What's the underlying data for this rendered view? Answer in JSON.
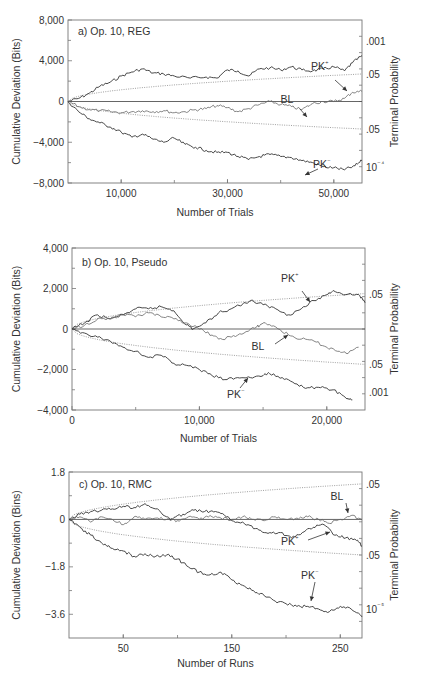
{
  "chart_data": [
    {
      "type": "line",
      "panel": "a",
      "title": "a) Op. 10, REG",
      "xlabel": "Number of Trials",
      "ylabel": "Cumulative Deviation (Bits)",
      "y2label": "Terminal Probability",
      "xlim": [
        0,
        55300
      ],
      "ylim": [
        -8000,
        8000
      ],
      "x_ticks": [
        10000,
        30000,
        50000
      ],
      "x_tick_labels": [
        "10,000",
        "30,000",
        "50,000"
      ],
      "y_ticks": [
        8000,
        4000,
        0,
        -4000,
        -8000
      ],
      "y_tick_labels": [
        "8,000",
        "4,000",
        "0",
        "−4,000",
        "−8,000"
      ],
      "y2_tick_labels": [
        {
          "label": ".001",
          "y": 5900
        },
        {
          "label": ".05",
          "y": 2700
        },
        {
          "label": ".05",
          "y": -2700
        },
        {
          "label": "10⁻⁴",
          "y": -6400
        }
      ],
      "envelope_end": 2700,
      "series": [
        {
          "name": "PK+",
          "x": [
            0,
            2000,
            4000,
            6000,
            8000,
            10000,
            12000,
            14000,
            16000,
            18000,
            20000,
            23000,
            26000,
            28000,
            30000,
            32000,
            34000,
            36000,
            38000,
            40000,
            42000,
            44000,
            46000,
            48000,
            50000,
            52000,
            53500,
            55300
          ],
          "values": [
            0,
            300,
            800,
            1500,
            1900,
            2500,
            2900,
            3200,
            2800,
            2700,
            2500,
            2300,
            2400,
            2300,
            3100,
            3000,
            2500,
            3200,
            3300,
            3100,
            3400,
            3100,
            3000,
            3200,
            3400,
            3000,
            3800,
            4500
          ]
        },
        {
          "name": "BL",
          "x": [
            0,
            2000,
            4000,
            6000,
            8000,
            10000,
            12000,
            14000,
            16000,
            18000,
            20000,
            22000,
            24000,
            26000,
            28000,
            30000,
            32000,
            34000,
            36000,
            38000,
            40000,
            42000,
            44000,
            46000,
            48000,
            50000,
            52000,
            53500,
            55300
          ],
          "values": [
            0,
            -500,
            -800,
            -900,
            -1000,
            -1100,
            -1000,
            -900,
            -1000,
            -900,
            -1100,
            -1000,
            -800,
            -700,
            -400,
            -600,
            -1000,
            -700,
            -300,
            0,
            -300,
            -500,
            -800,
            -200,
            0,
            0,
            300,
            900,
            1000
          ]
        },
        {
          "name": "PK−",
          "x": [
            0,
            2000,
            4000,
            6000,
            8000,
            10000,
            12000,
            14000,
            16000,
            18000,
            20000,
            22000,
            24000,
            26000,
            28000,
            30000,
            32000,
            34000,
            36000,
            38000,
            40000,
            42000,
            44000,
            46000,
            48000,
            50000,
            52000,
            54000,
            55300
          ],
          "values": [
            0,
            -1000,
            -1700,
            -2100,
            -2500,
            -3000,
            -3500,
            -3200,
            -3700,
            -4000,
            -3600,
            -4200,
            -4500,
            -4800,
            -5000,
            -5000,
            -5400,
            -5700,
            -5400,
            -5200,
            -5400,
            -5500,
            -5800,
            -6000,
            -6400,
            -6500,
            -6700,
            -6300,
            -5800
          ]
        }
      ],
      "annotations": [
        {
          "text": "PK⁺",
          "target": "PK+"
        },
        {
          "text": "BL",
          "target": "BL"
        },
        {
          "text": "PK⁻",
          "target": "PK−"
        }
      ]
    },
    {
      "type": "line",
      "panel": "b",
      "title": "b) Op. 10, Pseudo",
      "xlabel": "Number of Trials",
      "ylabel": "Cumulative Deviation (Bits)",
      "y2label": "Terminal Probability",
      "xlim": [
        0,
        23000
      ],
      "ylim": [
        -4000,
        4000
      ],
      "x_ticks": [
        0,
        10000,
        20000
      ],
      "x_tick_labels": [
        "0",
        "10,000",
        "20,000"
      ],
      "y_ticks": [
        4000,
        2000,
        0,
        -2000,
        -4000
      ],
      "y_tick_labels": [
        "4,000",
        "2,000",
        "0",
        "−2,000",
        "−4,000"
      ],
      "y2_tick_labels": [
        {
          "label": ".05",
          "y": 1750
        },
        {
          "label": ".05",
          "y": -1750
        },
        {
          "label": ".001",
          "y": -3100
        }
      ],
      "envelope_end": 1750,
      "series": [
        {
          "name": "PK+",
          "x": [
            0,
            1000,
            2000,
            3000,
            4000,
            5000,
            6000,
            7000,
            8000,
            9000,
            9500,
            10500,
            11500,
            12500,
            14000,
            15000,
            16000,
            17000,
            18000,
            19000,
            20000,
            20500,
            21500,
            22500,
            23000
          ],
          "values": [
            0,
            300,
            700,
            500,
            700,
            1000,
            1000,
            1100,
            900,
            200,
            0,
            300,
            800,
            1000,
            1400,
            1200,
            1000,
            700,
            1000,
            1400,
            1700,
            1900,
            1700,
            1700,
            1300
          ]
        },
        {
          "name": "BL",
          "x": [
            0,
            1000,
            2000,
            3000,
            4000,
            5000,
            6000,
            7000,
            8000,
            9000,
            10000,
            11000,
            11500,
            12500,
            13500,
            14500,
            15000,
            16000,
            17000,
            18000,
            19000,
            20000,
            21000,
            21500,
            22500
          ],
          "values": [
            0,
            200,
            500,
            500,
            700,
            600,
            800,
            600,
            500,
            300,
            0,
            -300,
            -500,
            -400,
            -200,
            100,
            300,
            100,
            -300,
            -500,
            -600,
            -900,
            -1100,
            -1200,
            -900
          ]
        },
        {
          "name": "PK−",
          "x": [
            0,
            1000,
            2000,
            3000,
            4000,
            5000,
            6000,
            7000,
            8000,
            9000,
            10000,
            11000,
            12000,
            13000,
            14000,
            15000,
            15500,
            16500,
            17500,
            18500,
            19500,
            20500,
            21500,
            22000
          ],
          "values": [
            0,
            -200,
            -400,
            -600,
            -900,
            -1100,
            -1400,
            -1300,
            -1700,
            -1800,
            -2000,
            -2300,
            -2500,
            -2400,
            -2400,
            -2300,
            -2200,
            -2400,
            -2700,
            -2900,
            -2900,
            -3000,
            -3400,
            -3500
          ]
        }
      ],
      "annotations": [
        {
          "text": "PK⁺",
          "target": "PK+"
        },
        {
          "text": "BL",
          "target": "BL"
        },
        {
          "text": "PK⁻",
          "target": "PK−"
        }
      ]
    },
    {
      "type": "line",
      "panel": "c",
      "title": "c) Op. 10, RMC",
      "xlabel": "Number of Runs",
      "ylabel": "Cumulative Deviation (Bins)",
      "y2label": "Terminal Probability",
      "xlim": [
        0,
        270
      ],
      "ylim": [
        -4.5,
        1.8
      ],
      "x_ticks": [
        50,
        150,
        250
      ],
      "x_tick_labels": [
        "50",
        "150",
        "250"
      ],
      "y_ticks": [
        1.8,
        0,
        -1.8,
        -3.6
      ],
      "y_tick_labels": [
        "1.8",
        "0",
        "−1.8",
        "−3.6"
      ],
      "y2_tick_labels": [
        {
          "label": ".05",
          "y": 1.35
        },
        {
          "label": ".05",
          "y": -1.35
        },
        {
          "label": "10⁻⁵",
          "y": -3.4
        }
      ],
      "envelope_end": 1.35,
      "series": [
        {
          "name": "PK+",
          "x": [
            0,
            10,
            20,
            30,
            40,
            50,
            60,
            70,
            80,
            90,
            95,
            105,
            115,
            125,
            135,
            145,
            155,
            165,
            175,
            185,
            195,
            205,
            215,
            225,
            235,
            245,
            255,
            265,
            270
          ],
          "values": [
            0,
            0.2,
            0.3,
            0.35,
            0.4,
            0.5,
            0.45,
            0.6,
            0.4,
            0.1,
            0.0,
            0.2,
            0.35,
            0.3,
            0.3,
            0.1,
            -0.1,
            -0.2,
            -0.4,
            -0.5,
            -0.5,
            -0.7,
            -0.5,
            -0.3,
            -0.2,
            -0.6,
            -0.7,
            -0.8,
            -1.0
          ]
        },
        {
          "name": "BL",
          "x": [
            0,
            10,
            20,
            30,
            40,
            50,
            60,
            70,
            80,
            90,
            100,
            110,
            120,
            130,
            140,
            150,
            160,
            170,
            180,
            190,
            200,
            210,
            220,
            230,
            240,
            250,
            260,
            270
          ],
          "values": [
            0,
            0.1,
            -0.1,
            0.1,
            0.0,
            -0.2,
            0.1,
            0.0,
            0.05,
            0.0,
            -0.05,
            0.1,
            0.0,
            0.15,
            0.05,
            0.0,
            0.1,
            0.0,
            -0.05,
            0.1,
            0.0,
            0.05,
            0.1,
            0.0,
            -0.15,
            0.0,
            0.15,
            0.0
          ]
        },
        {
          "name": "PK−",
          "x": [
            0,
            10,
            20,
            30,
            40,
            50,
            60,
            70,
            80,
            90,
            100,
            110,
            120,
            130,
            140,
            150,
            160,
            170,
            180,
            190,
            200,
            210,
            220,
            230,
            240,
            250,
            260,
            270
          ],
          "values": [
            0,
            -0.3,
            -0.6,
            -0.9,
            -1.1,
            -1.2,
            -1.4,
            -1.3,
            -1.4,
            -1.35,
            -1.5,
            -1.8,
            -2.0,
            -2.1,
            -2.0,
            -2.3,
            -2.5,
            -2.7,
            -2.9,
            -3.1,
            -3.2,
            -3.3,
            -3.3,
            -3.4,
            -3.5,
            -3.3,
            -3.4,
            -3.7
          ]
        }
      ],
      "annotations": [
        {
          "text": "BL",
          "target": "BL"
        },
        {
          "text": "PK⁺",
          "target": "PK+"
        },
        {
          "text": "PK⁻",
          "target": "PK−"
        }
      ]
    }
  ],
  "panels": {
    "a": {
      "title": "a) Op. 10, REG",
      "xlabel": "Number of Trials",
      "ylabel": "Cumulative Deviation (Bits)",
      "y2label": "Terminal Probability"
    },
    "b": {
      "title": "b) Op. 10, Pseudo",
      "xlabel": "Number of Trials",
      "ylabel": "Cumulative Deviation (Bits)",
      "y2label": "Terminal Probability"
    },
    "c": {
      "title": "c) Op. 10, RMC",
      "xlabel": "Number of Runs",
      "ylabel": "Cumulative Deviation (Bins)",
      "y2label": "Terminal Probability"
    }
  },
  "labels": {
    "pk_plus": "PK",
    "pk_minus": "PK",
    "bl": "BL",
    "plus_sup": "+",
    "minus_sup": "−"
  }
}
